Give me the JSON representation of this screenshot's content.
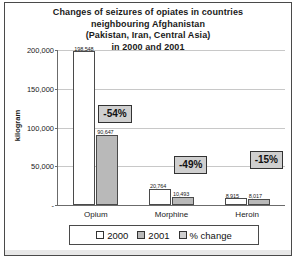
{
  "chart_data": {
    "type": "bar",
    "title": "Changes of seizures of opiates in countries neighbouring Afghanistan (Pakistan, Iran, Central Asia) in 2000 and 2001",
    "title_lines": [
      "Changes of seizures of opiates in countries",
      "neighbouring Afghanistan",
      "(Pakistan, Iran, Central Asia)",
      "in 2000 and 2001"
    ],
    "xlabel": "",
    "ylabel": "kilogram",
    "ylim": [
      0,
      200000
    ],
    "yticks": [
      0,
      50000,
      100000,
      150000,
      200000
    ],
    "ytick_labels": [
      "-",
      "50,000",
      "100,000",
      "150,000",
      "200,000"
    ],
    "grid": true,
    "legend_position": "bottom",
    "categories": [
      "Opium",
      "Morphine",
      "Heroin"
    ],
    "series": [
      {
        "name": "2000",
        "color": "#ffffff",
        "values": [
          198548,
          20764,
          8915
        ],
        "labels": [
          "198,548",
          "20,764",
          "8,915"
        ]
      },
      {
        "name": "2001",
        "color": "#b9b9b9",
        "values": [
          90647,
          10493,
          8017
        ],
        "labels": [
          "90,647",
          "10,493",
          "8,017"
        ]
      },
      {
        "name": "% change",
        "color": "#cfcfcf",
        "values": [
          -54,
          -49,
          -15
        ],
        "labels": [
          "-54%",
          "-49%",
          "-15%"
        ]
      }
    ]
  },
  "legend": {
    "items": [
      {
        "label": "2000"
      },
      {
        "label": "2001"
      },
      {
        "label": "% change"
      }
    ]
  }
}
